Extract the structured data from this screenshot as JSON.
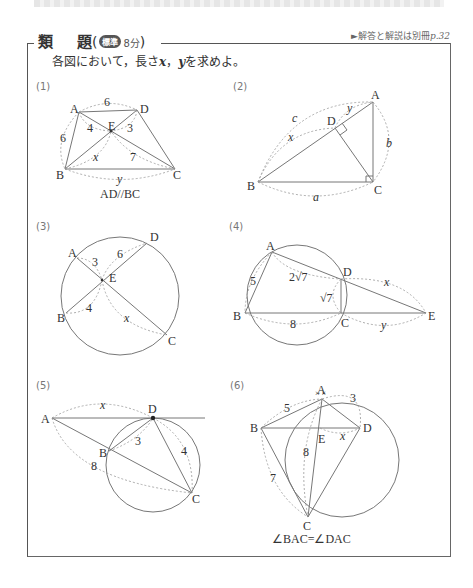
{
  "header": {
    "title_part1": "類",
    "title_part2": "題",
    "paren_open": "(",
    "paren_close": ")",
    "difficulty_badge": "標準",
    "time": "8分",
    "answer_reference": "►解答と解説は別冊",
    "answer_page": "p.32"
  },
  "instruction": {
    "prefix": "各図において，長さ",
    "var1": "x",
    "sep": "，",
    "var2": "y",
    "suffix": "を求めよ。"
  },
  "problems": [
    {
      "number": "(1)",
      "caption": "AD//BC",
      "labels": {
        "A": "A",
        "B": "B",
        "C": "C",
        "D": "D",
        "E": "E"
      },
      "values": {
        "AD": "6",
        "AB": "6",
        "AE": "4",
        "DE": "3",
        "CE": "7",
        "BE": "x",
        "BC": "y"
      }
    },
    {
      "number": "(2)",
      "labels": {
        "A": "A",
        "B": "B",
        "C": "C",
        "D": "D"
      },
      "values": {
        "AB": "c",
        "AC": "b",
        "BC": "a",
        "BD": "x",
        "DA": "y"
      }
    },
    {
      "number": "(3)",
      "labels": {
        "A": "A",
        "B": "B",
        "C": "C",
        "D": "D",
        "E": "E"
      },
      "values": {
        "AE": "3",
        "DE": "6",
        "BE": "4",
        "CE": "x"
      }
    },
    {
      "number": "(4)",
      "labels": {
        "A": "A",
        "B": "B",
        "C": "C",
        "D": "D",
        "E": "E"
      },
      "values": {
        "AB": "5",
        "AD": "2√7",
        "CD": "√7",
        "BC": "8",
        "DE": "x",
        "CE": "y"
      }
    },
    {
      "number": "(5)",
      "labels": {
        "A": "A",
        "B": "B",
        "C": "C",
        "D": "D"
      },
      "values": {
        "AD": "x",
        "BD": "3",
        "CD": "4",
        "AC": "8"
      }
    },
    {
      "number": "(6)",
      "caption": "∠BAC=∠DAC",
      "labels": {
        "A": "A",
        "B": "B",
        "C": "C",
        "D": "D",
        "E": "E"
      },
      "values": {
        "AB": "5",
        "AD": "3",
        "BC": "7",
        "AC": "8",
        "ED": "x"
      }
    }
  ]
}
